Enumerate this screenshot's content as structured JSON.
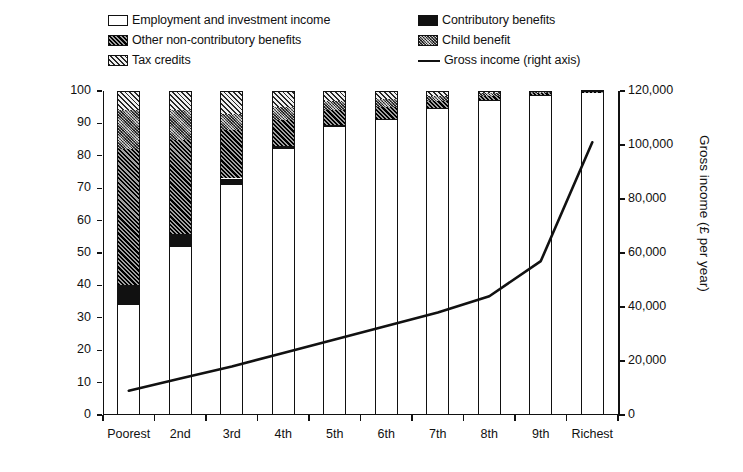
{
  "chart_data": {
    "type": "bar",
    "subtype": "stacked-bar-with-line",
    "title": "",
    "xlabel": "",
    "ylabel": "Proportion of income (%)",
    "ylabel_right": "Gross income (£ per year)",
    "ylim": [
      0,
      100
    ],
    "ylim_right": [
      0,
      120000
    ],
    "yticks": [
      0,
      10,
      20,
      30,
      40,
      50,
      60,
      70,
      80,
      90,
      100
    ],
    "ytick_labels": [
      "0",
      "10",
      "20",
      "30",
      "40",
      "50",
      "60",
      "70",
      "80",
      "90",
      "100"
    ],
    "yticks_right": [
      0,
      20000,
      40000,
      60000,
      80000,
      100000,
      120000
    ],
    "ytick_labels_right": [
      "0",
      "20,000",
      "40,000",
      "60,000",
      "80,000",
      "100,000",
      "120,000"
    ],
    "grid": false,
    "legend_position": "top",
    "categories": [
      "Poorest",
      "2nd",
      "3rd",
      "4th",
      "5th",
      "6th",
      "7th",
      "8th",
      "9th",
      "Richest"
    ],
    "series": [
      {
        "name": "Employment and investment income",
        "pattern": "white",
        "values": [
          34,
          52,
          71,
          82,
          89,
          91,
          94.5,
          97,
          98.5,
          99.3
        ]
      },
      {
        "name": "Contributory benefits",
        "pattern": "solid-black",
        "values": [
          6,
          4,
          2,
          1,
          0.6,
          0.5,
          0.4,
          0.3,
          0.2,
          0.2
        ]
      },
      {
        "name": "Other non-contributory benefits",
        "pattern": "dark-diagonal-hatch",
        "values": [
          42,
          29,
          15,
          8,
          4.4,
          3.5,
          2.1,
          1.2,
          0.6,
          0.2
        ]
      },
      {
        "name": "Child benefit",
        "pattern": "grey-crosshatch",
        "values": [
          12,
          9,
          5,
          4,
          3,
          2.5,
          1.5,
          0.8,
          0.4,
          0.2
        ]
      },
      {
        "name": "Tax credits",
        "pattern": "light-diagonal-hatch",
        "values": [
          6,
          6,
          7,
          5,
          3,
          2.5,
          1.5,
          0.7,
          0.3,
          0.1
        ]
      }
    ],
    "line_series": {
      "name": "Gross income (right axis)",
      "axis": "right",
      "units": "£ per year",
      "values": [
        9000,
        13500,
        18000,
        23000,
        28000,
        33000,
        38000,
        44000,
        57000,
        101000
      ]
    }
  },
  "legend": {
    "items": [
      {
        "label": "Employment and investment income",
        "pattern": "white"
      },
      {
        "label": "Contributory benefits",
        "pattern": "solid-black"
      },
      {
        "label": "Other non-contributory benefits",
        "pattern": "dark-diagonal-hatch"
      },
      {
        "label": "Child benefit",
        "pattern": "grey-crosshatch"
      },
      {
        "label": "Tax credits",
        "pattern": "light-diagonal-hatch"
      },
      {
        "label": "Gross income (right axis)",
        "pattern": "line"
      }
    ]
  },
  "colors": {
    "axis": "#111111",
    "employment": "#ffffff",
    "contributory": "#111111",
    "other_non_contributory": "#2a2a2a",
    "child_benefit": "#7b7b7b",
    "tax_credits": "#9a9a9a",
    "line": "#111111"
  }
}
